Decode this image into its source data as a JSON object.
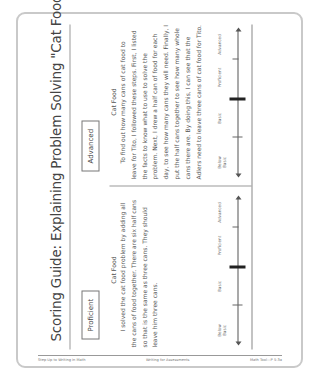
{
  "document": {
    "title": "Scoring Guide: Explaining Problem Solving \"Cat Food\"",
    "orientation": "rotated -90deg (landscape page shown in portrait)"
  },
  "samples": [
    {
      "level": "Proficient",
      "heading": "Cat Food",
      "text": "I solved the cat food problem by adding all the cans of food together. There are six half cans so that is the same as three cans. They should leave him three cans.",
      "scale": {
        "labels": [
          "Below Basic",
          "Basic",
          "Proficient",
          "Advanced"
        ],
        "marker_position": "between Basic and Proficient"
      }
    },
    {
      "level": "Advanced",
      "heading": "Cat Food",
      "text": "To find out how many cans of cat food to leave for Tito, I followed these steps. First, I listed the facts to know what to use to solve the problem. Next, I drew a half can of food for each day, to see how many cans they will need. Finally, I put the half cans together to see how many whole cans there are. By doing this, I can see that the Adlers need to leave three cans of cat food for Tito.",
      "scale": {
        "labels": [
          "Below Basic",
          "Basic",
          "Proficient",
          "Advanced"
        ],
        "marker_position": "between Basic and Proficient"
      }
    }
  ],
  "footer": {
    "left": "Step Up to Writing in Math",
    "center": "Writing for Assessments",
    "right": "Math Tool—P 5-3a"
  },
  "colors": {
    "border": "#c9c9c9",
    "text": "#555555",
    "marker": "#222222"
  }
}
